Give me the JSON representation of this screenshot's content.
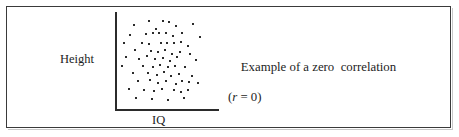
{
  "figure": {
    "border_color": "#3a3a3a",
    "background": "#ffffff"
  },
  "caption": {
    "line1": "Example of a zero  correlation",
    "r_symbol": "r",
    "r_statement": " = 0)",
    "paren_open": "(",
    "full_line2": "(r = 0)"
  },
  "chart_data": {
    "type": "scatter",
    "title": "",
    "xlabel": "IQ",
    "ylabel": "Height",
    "annotation": "Example of a zero  correlation (r = 0)",
    "correlation_r": 0,
    "grid": false,
    "legend": "none",
    "axis_color": "#2b2b2b",
    "point_color": "#2b2b2b",
    "xlim": [
      0,
      100
    ],
    "ylim": [
      0,
      100
    ],
    "points": [
      [
        14,
        89
      ],
      [
        29,
        93
      ],
      [
        36,
        85
      ],
      [
        44,
        93
      ],
      [
        50,
        92
      ],
      [
        57,
        88
      ],
      [
        75,
        90
      ],
      [
        9,
        78
      ],
      [
        26,
        79
      ],
      [
        33,
        80
      ],
      [
        40,
        80
      ],
      [
        47,
        81
      ],
      [
        54,
        77
      ],
      [
        63,
        80
      ],
      [
        82,
        76
      ],
      [
        3,
        70
      ],
      [
        22,
        70
      ],
      [
        29,
        69
      ],
      [
        42,
        70
      ],
      [
        48,
        70
      ],
      [
        55,
        70
      ],
      [
        62,
        71
      ],
      [
        70,
        66
      ],
      [
        15,
        62
      ],
      [
        31,
        61
      ],
      [
        38,
        60
      ],
      [
        46,
        62
      ],
      [
        53,
        58
      ],
      [
        61,
        60
      ],
      [
        72,
        58
      ],
      [
        5,
        54
      ],
      [
        19,
        52
      ],
      [
        27,
        56
      ],
      [
        35,
        52
      ],
      [
        44,
        53
      ],
      [
        51,
        50
      ],
      [
        58,
        54
      ],
      [
        78,
        51
      ],
      [
        1,
        45
      ],
      [
        23,
        45
      ],
      [
        33,
        44
      ],
      [
        41,
        46
      ],
      [
        49,
        43
      ],
      [
        56,
        45
      ],
      [
        67,
        43
      ],
      [
        12,
        37
      ],
      [
        28,
        37
      ],
      [
        37,
        35
      ],
      [
        45,
        38
      ],
      [
        52,
        34
      ],
      [
        60,
        36
      ],
      [
        74,
        34
      ],
      [
        18,
        28
      ],
      [
        30,
        29
      ],
      [
        39,
        26
      ],
      [
        47,
        28
      ],
      [
        57,
        25
      ],
      [
        64,
        28
      ],
      [
        71,
        27
      ],
      [
        80,
        26
      ],
      [
        8,
        20
      ],
      [
        24,
        19
      ],
      [
        34,
        17
      ],
      [
        43,
        20
      ],
      [
        55,
        18
      ],
      [
        62,
        16
      ],
      [
        70,
        19
      ],
      [
        16,
        10
      ],
      [
        32,
        9
      ],
      [
        49,
        8
      ],
      [
        66,
        10
      ]
    ]
  }
}
